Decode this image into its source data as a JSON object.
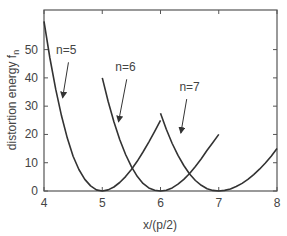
{
  "chart_data": {
    "type": "line",
    "title": "",
    "xlabel": "x/(p/2)",
    "ylabel": "distortion energy f",
    "ylabel_subscript": "n",
    "xlim": [
      4,
      8
    ],
    "ylim": [
      0,
      64
    ],
    "xticks": [
      4,
      5,
      6,
      7,
      8
    ],
    "xtick_labels": [
      "4",
      "5",
      "6",
      "7",
      "8"
    ],
    "yticks": [
      0,
      10,
      20,
      30,
      40,
      50
    ],
    "ytick_labels": [
      "0",
      "10",
      "20",
      "30",
      "40",
      "50"
    ],
    "grid": false,
    "legend": "none (inline annotations)",
    "series": [
      {
        "name": "n=5",
        "x": [
          4.0,
          4.1,
          4.2,
          4.3,
          4.4,
          4.5,
          4.6,
          4.7,
          4.8,
          4.9,
          5.0,
          5.1,
          5.2,
          5.3,
          5.4,
          5.5,
          5.6,
          5.7,
          5.8,
          5.9,
          6.0
        ],
        "values": [
          60.0,
          47.2,
          36.0,
          26.6,
          18.7,
          12.3,
          7.6,
          4.1,
          1.8,
          0.4,
          0.0,
          0.4,
          1.4,
          3.0,
          5.1,
          7.6,
          10.5,
          13.8,
          17.3,
          21.1,
          25.0
        ]
      },
      {
        "name": "n=6",
        "x": [
          5.0,
          5.1,
          5.2,
          5.3,
          5.4,
          5.5,
          5.6,
          5.7,
          5.8,
          5.9,
          6.0,
          6.1,
          6.2,
          6.3,
          6.4,
          6.5,
          6.6,
          6.7,
          6.8,
          6.9,
          7.0
        ],
        "values": [
          40.0,
          31.7,
          24.5,
          18.2,
          12.9,
          8.6,
          5.2,
          2.7,
          1.1,
          0.3,
          0.0,
          0.3,
          1.1,
          2.4,
          4.1,
          6.2,
          8.7,
          11.4,
          14.4,
          17.1,
          20.0
        ]
      },
      {
        "name": "n=7",
        "x": [
          6.0,
          6.1,
          6.2,
          6.3,
          6.4,
          6.5,
          6.6,
          6.7,
          6.8,
          6.9,
          7.0,
          7.1,
          7.2,
          7.3,
          7.4,
          7.5,
          7.6,
          7.7,
          7.8,
          7.9,
          8.0
        ],
        "values": [
          27.5,
          21.8,
          16.8,
          12.6,
          9.0,
          6.0,
          3.7,
          2.0,
          0.8,
          0.2,
          0.0,
          0.2,
          0.7,
          1.6,
          2.7,
          4.1,
          5.8,
          7.7,
          9.9,
          12.3,
          15.0
        ]
      }
    ],
    "annotations": [
      {
        "text": "n=5",
        "label_x": 4.38,
        "label_y": 48.5,
        "arrow_from": [
          4.42,
          45.5
        ],
        "arrow_to": [
          4.32,
          33.0
        ]
      },
      {
        "text": "n=6",
        "label_x": 5.4,
        "label_y": 42.5,
        "arrow_from": [
          5.42,
          39.5
        ],
        "arrow_to": [
          5.28,
          24.5
        ]
      },
      {
        "text": "n=7",
        "label_x": 6.5,
        "label_y": 35.5,
        "arrow_from": [
          6.45,
          32.5
        ],
        "arrow_to": [
          6.35,
          20.5
        ]
      }
    ],
    "colors": {
      "line": "#333333",
      "frame": "#555555",
      "text": "#444444"
    }
  }
}
